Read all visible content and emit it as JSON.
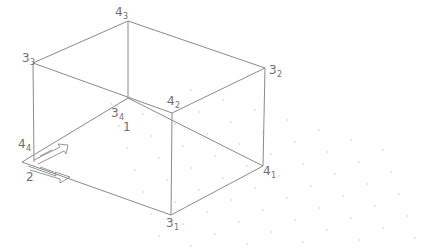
{
  "diagram": {
    "type": "isometric-box-wireframe",
    "colors": {
      "edge": "#8a8a8a",
      "label": "#6f6f6f",
      "dots": "#c8c8c8",
      "background": "#ffffff"
    },
    "vertices": {
      "v43": [
        128,
        21
      ],
      "v33": [
        33,
        63
      ],
      "v32": [
        265,
        68
      ],
      "v42": [
        172,
        113
      ],
      "v34": [
        128,
        98
      ],
      "v44": [
        34,
        162
      ],
      "v2c": [
        22,
        162
      ],
      "v41": [
        263,
        166
      ],
      "v31": [
        171,
        215
      ]
    },
    "labels": [
      {
        "id": "label-4-3",
        "base": "4",
        "sub": "3",
        "x": 115,
        "y": 16
      },
      {
        "id": "label-3-3",
        "base": "3",
        "sub": "3",
        "x": 22,
        "y": 62
      },
      {
        "id": "label-3-2",
        "base": "3",
        "sub": "2",
        "x": 269,
        "y": 74
      },
      {
        "id": "label-4-2",
        "base": "4",
        "sub": "2",
        "x": 167,
        "y": 105
      },
      {
        "id": "label-3-4",
        "base": "3",
        "sub": "4",
        "x": 111,
        "y": 117
      },
      {
        "id": "label-1",
        "base": "1",
        "sub": "",
        "x": 123,
        "y": 131
      },
      {
        "id": "label-4-4",
        "base": "4",
        "sub": "4",
        "x": 18,
        "y": 148
      },
      {
        "id": "label-2",
        "base": "2",
        "sub": "",
        "x": 26,
        "y": 181
      },
      {
        "id": "label-4-1",
        "base": "4",
        "sub": "1",
        "x": 263,
        "y": 175
      },
      {
        "id": "label-3-1",
        "base": "3",
        "sub": "1",
        "x": 166,
        "y": 227
      }
    ]
  }
}
